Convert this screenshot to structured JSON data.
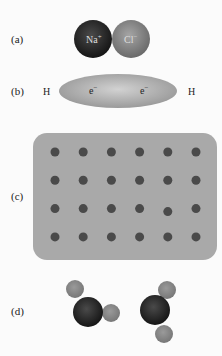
{
  "panels": {
    "a": {
      "label": "(a)",
      "cation": {
        "symbol": "Na",
        "charge": "+"
      },
      "anion": {
        "symbol": "Cl",
        "charge": "−"
      }
    },
    "b": {
      "label": "(b)",
      "left_atom": "H",
      "right_atom": "H",
      "electrons": [
        {
          "symbol": "e",
          "charge": "−"
        },
        {
          "symbol": "e",
          "charge": "−"
        }
      ]
    },
    "c": {
      "label": "(c)",
      "lattice_rows": 4,
      "lattice_cols": 6,
      "displaced_ion": {
        "row": 3,
        "col": 5
      }
    },
    "d": {
      "label": "(d)",
      "molecules": 2
    }
  },
  "colors": {
    "dark_atom": "#222222",
    "gray_atom": "#8a8a8a",
    "cloud": "#a8a8a8",
    "lattice_bg": "#a9a9a9",
    "lattice_dot": "#4a4a4a"
  }
}
